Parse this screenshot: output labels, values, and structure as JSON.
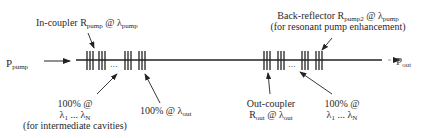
{
  "diagram": {
    "input": {
      "symbol": "P",
      "subscript": "pump"
    },
    "output": {
      "symbol": "P",
      "subscript": "out"
    },
    "in_coupler": {
      "text": "In-coupler R",
      "sub1": "pump",
      "mid": " @ λ",
      "sub2": "pump"
    },
    "back_reflector": {
      "text": "Back-reflector R",
      "sub1": "pump2",
      "mid": " @ λ",
      "sub2": "pump",
      "note": "(for resonant pump enhancement)"
    },
    "left_hr": {
      "line1": "100% @",
      "line2_a": "λ",
      "line2_sub1": "1",
      "line2_mid": " ... λ",
      "line2_sub2": "N",
      "note": "(for intermediate cavities)"
    },
    "left_out_hr": {
      "text": "100% @ λ",
      "sub": "out"
    },
    "out_coupler": {
      "line1": "Out-coupler",
      "line2_a": "R",
      "line2_sub1": "out",
      "line2_mid": " @ λ",
      "line2_sub2": "out"
    },
    "right_hr": {
      "line1": "100% @",
      "line2_a": "λ",
      "line2_sub1": "1",
      "line2_mid": " ... λ",
      "line2_sub2": "N"
    },
    "ellipsis": "..."
  }
}
